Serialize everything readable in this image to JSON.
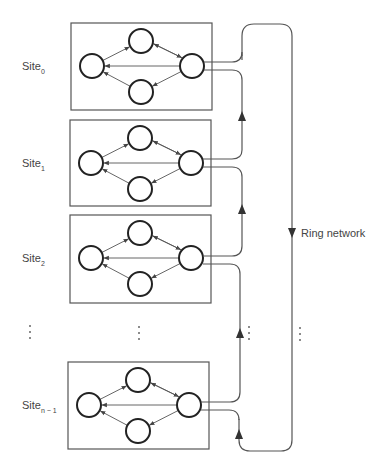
{
  "diagram": {
    "type": "distributed-system-ring-network",
    "ring_label": "Ring network",
    "sites": [
      {
        "name": "Site",
        "subscript": "0",
        "box": {
          "x": 71,
          "y": 23,
          "w": 141,
          "h": 87
        }
      },
      {
        "name": "Site",
        "subscript": "1",
        "box": {
          "x": 70,
          "y": 120,
          "w": 141,
          "h": 86
        }
      },
      {
        "name": "Site",
        "subscript": "2",
        "box": {
          "x": 70,
          "y": 215,
          "w": 141,
          "h": 88
        }
      },
      {
        "name": "Site",
        "subscript": "n − 1",
        "box": {
          "x": 68,
          "y": 362,
          "w": 141,
          "h": 87
        }
      }
    ],
    "ellipsis": "⋮",
    "node_layout": {
      "left": [
        21,
        43
      ],
      "top": [
        70,
        18
      ],
      "right": [
        121,
        43
      ],
      "bottom": [
        70,
        69
      ],
      "radius": 12
    },
    "edges": [
      {
        "from": "left",
        "to": "top"
      },
      {
        "from": "top",
        "to": "right"
      },
      {
        "from": "right",
        "to": "top"
      },
      {
        "from": "right",
        "to": "left"
      },
      {
        "from": "right",
        "to": "bottom"
      },
      {
        "from": "bottom",
        "to": "left"
      }
    ],
    "colors": {
      "line": "#555555",
      "node_stroke": "#222222",
      "background": "#ffffff"
    }
  }
}
